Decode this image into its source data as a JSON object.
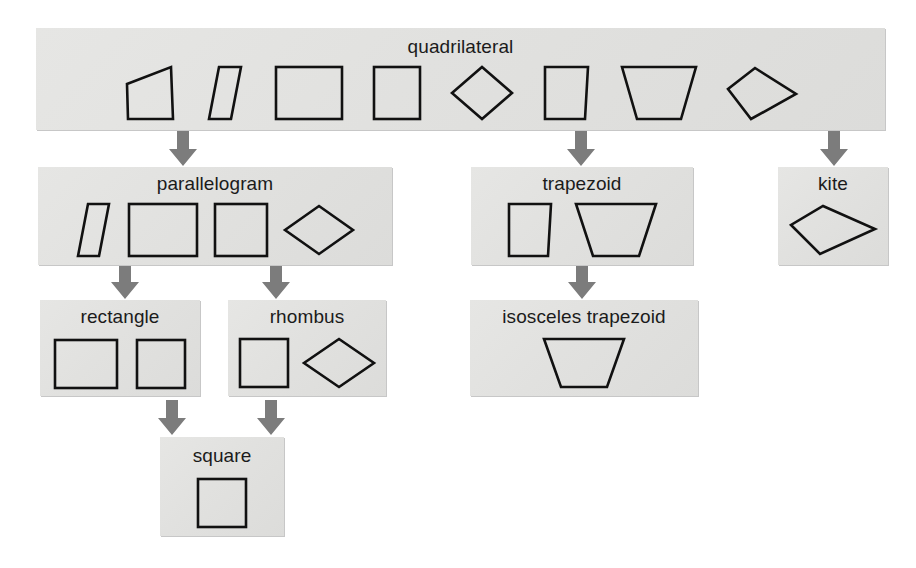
{
  "diagram": {
    "background_color": "#ffffff",
    "node_fill_color": "#e2e2e0",
    "shape_stroke_color": "#111111",
    "arrow_color": "#7a7a7a",
    "label_color": "#1b1b1b"
  },
  "nodes": {
    "quadrilateral": {
      "label": "quadrilateral",
      "shapes": [
        "irregular-quadrilateral",
        "narrow-parallelogram",
        "wide-rectangle",
        "tall-rectangle",
        "rhombus-diamond",
        "right-trapezoid",
        "isosceles-trapezoid",
        "kite"
      ]
    },
    "parallelogram": {
      "label": "parallelogram",
      "shapes": [
        "narrow-parallelogram",
        "wide-rectangle",
        "square",
        "rhombus-diamond"
      ]
    },
    "trapezoid": {
      "label": "trapezoid",
      "shapes": [
        "right-trapezoid",
        "isosceles-trapezoid"
      ]
    },
    "kite": {
      "label": "kite",
      "shapes": [
        "kite"
      ]
    },
    "rectangle": {
      "label": "rectangle",
      "shapes": [
        "wide-rectangle",
        "square"
      ]
    },
    "rhombus": {
      "label": "rhombus",
      "shapes": [
        "square",
        "rhombus-diamond"
      ]
    },
    "isosceles_trapezoid": {
      "label": "isosceles trapezoid",
      "shapes": [
        "isosceles-trapezoid"
      ]
    },
    "square": {
      "label": "square",
      "shapes": [
        "square"
      ]
    }
  },
  "edges": [
    {
      "id": "quad-par",
      "from": "quadrilateral",
      "to": "parallelogram"
    },
    {
      "id": "quad-trap",
      "from": "quadrilateral",
      "to": "trapezoid"
    },
    {
      "id": "quad-kite",
      "from": "quadrilateral",
      "to": "kite"
    },
    {
      "id": "par-rect",
      "from": "parallelogram",
      "to": "rectangle"
    },
    {
      "id": "par-rhom",
      "from": "parallelogram",
      "to": "rhombus"
    },
    {
      "id": "trap-iso",
      "from": "trapezoid",
      "to": "isosceles_trapezoid"
    },
    {
      "id": "rect-sq",
      "from": "rectangle",
      "to": "square"
    },
    {
      "id": "rhom-sq",
      "from": "rhombus",
      "to": "square"
    }
  ]
}
